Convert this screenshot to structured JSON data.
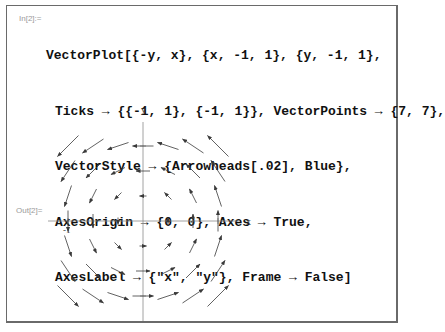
{
  "notebook": {
    "input_label": "In[2]:=",
    "output_label": "Out[2]=",
    "code_lines": [
      "VectorPlot[{-y, x}, {x, -1, 1}, {y, -1, 1},",
      "Ticks → {{-1, 1}, {-1, 1}}, VectorPoints → {7, 7},",
      "VectorStyle → {Arrowheads[.02], Blue},",
      "AxesOrigin → {0, 0}, Axes → True,",
      "AxesLabel → {\"x\", \"y\"}, Frame → False]"
    ]
  },
  "chart_data": {
    "type": "vector_field",
    "function": "{-y, x}",
    "x_range": [
      -1,
      1
    ],
    "y_range": [
      -1,
      1
    ],
    "vector_points": [
      7,
      7
    ],
    "xlabel": "x",
    "ylabel": "y",
    "x_ticks": [
      -1,
      1
    ],
    "y_ticks": [
      -1,
      1
    ],
    "visible_tick_label": "-1",
    "axes_origin": [
      0,
      0
    ],
    "frame": false,
    "arrow_color": "#3a3a3a"
  }
}
